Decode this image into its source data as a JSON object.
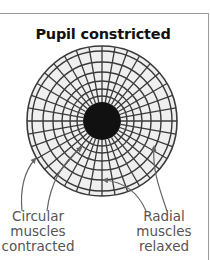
{
  "title": "Pupil constricted",
  "colors": {
    "iris_fill": "#efefef",
    "grid_line": "#3a3a3a",
    "pupil": "#111111",
    "label_text": "#555555",
    "arrow": "#666666",
    "rule": "#9a9a9a"
  },
  "diagram": {
    "center": [
      102,
      121
    ],
    "outer_radius": 75,
    "pupil_radius": 19,
    "ring_radii": [
      25,
      32,
      40,
      49,
      59,
      70
    ],
    "spoke_count": 36
  },
  "labels": {
    "left": {
      "lines": [
        "Circular",
        "muscles",
        "contracted"
      ]
    },
    "right": {
      "lines": [
        "Radial",
        "muscles",
        "relaxed"
      ]
    }
  }
}
